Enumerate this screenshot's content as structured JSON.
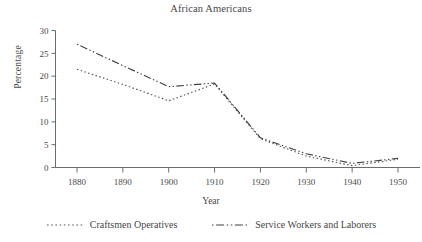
{
  "chart_data": {
    "type": "line",
    "title": "African Americans",
    "xlabel": "Year",
    "ylabel": "Percentage",
    "x": [
      1880,
      1890,
      1900,
      1910,
      1920,
      1930,
      1940,
      1950
    ],
    "xtick_labels": [
      "1880",
      "1890",
      "1900",
      "1910",
      "1920",
      "1930",
      "1940",
      "1950"
    ],
    "ytick_labels": [
      "0",
      "5",
      "10",
      "15",
      "20",
      "25",
      "30"
    ],
    "ylim": [
      0,
      30
    ],
    "xlim": [
      1880,
      1950
    ],
    "ytick_step": 5,
    "grid": false,
    "legend_position": "bottom",
    "series": [
      {
        "name": "Craftsmen Operatives",
        "style": "dotted",
        "color": "#555555",
        "values": [
          21.5,
          18.2,
          14.6,
          18.3,
          6.3,
          2.5,
          0.4,
          1.8
        ]
      },
      {
        "name": "Service Workers and Laborers",
        "style": "dash-dot",
        "color": "#404040",
        "values": [
          27.0,
          22.3,
          17.7,
          18.5,
          6.5,
          3.0,
          0.9,
          2.0
        ]
      }
    ]
  },
  "legend": {
    "items": [
      {
        "label": "Craftsmen Operatives"
      },
      {
        "label": "Service Workers and Laborers"
      }
    ]
  },
  "colors": {
    "axis": "#6b6b6b",
    "text": "#474747",
    "background": "#ffffff"
  }
}
